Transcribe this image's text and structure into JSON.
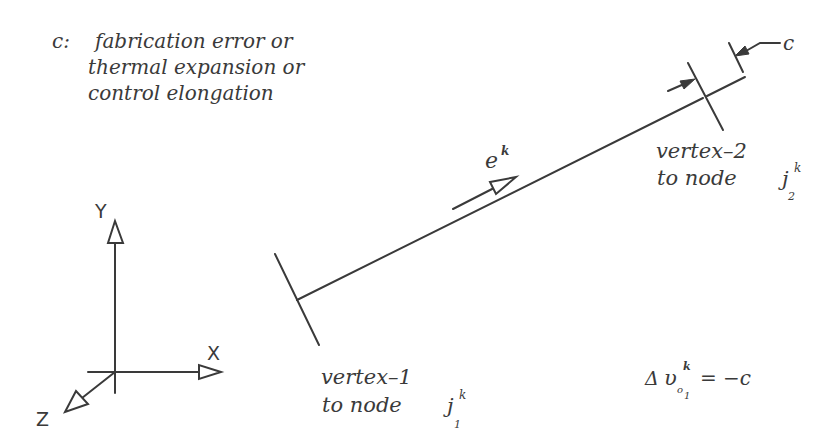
{
  "description": {
    "prefix": "c:",
    "lines": [
      "fabrication error or",
      "thermal expansion or",
      "control elongation"
    ]
  },
  "member": {
    "direction_label": "e",
    "direction_sup": "k",
    "vertex1": {
      "line1": "vertex–1",
      "line2": "to node",
      "node_symbol": "j",
      "node_sup": "k",
      "node_sub": "1"
    },
    "vertex2": {
      "line1": "vertex–2",
      "line2": "to node",
      "node_symbol": "j",
      "node_sup": "k",
      "node_sub": "2"
    },
    "gap_label": "c"
  },
  "equation": {
    "delta": "Δ",
    "symbol": "υ",
    "sup": "k",
    "sub_base": "o",
    "sub_index": "1",
    "rhs": "= −c"
  },
  "axes": {
    "x_label": "X",
    "y_label": "Y",
    "z_label": "Z"
  },
  "colors": {
    "ink": "#3a3a3a",
    "background": "#ffffff"
  }
}
